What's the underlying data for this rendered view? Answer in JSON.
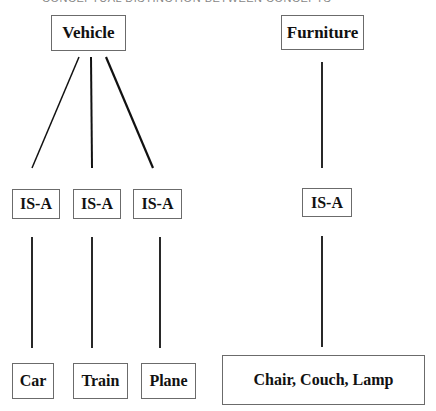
{
  "caption": "CONCEPTUAL DISTINCTION BETWEEN CONCEPTS",
  "nodes": {
    "vehicle": "Vehicle",
    "furniture": "Furniture",
    "isa_1": "IS-A",
    "isa_2": "IS-A",
    "isa_3": "IS-A",
    "isa_4": "IS-A",
    "car": "Car",
    "train": "Train",
    "plane": "Plane",
    "furniture_items": "Chair, Couch, Lamp"
  },
  "edges": [
    {
      "from": "Vehicle",
      "to": "IS-A (1)"
    },
    {
      "from": "Vehicle",
      "to": "IS-A (2)"
    },
    {
      "from": "Vehicle",
      "to": "IS-A (3)"
    },
    {
      "from": "IS-A (1)",
      "to": "Car"
    },
    {
      "from": "IS-A (2)",
      "to": "Train"
    },
    {
      "from": "IS-A (3)",
      "to": "Plane"
    },
    {
      "from": "Furniture",
      "to": "IS-A (4)"
    },
    {
      "from": "IS-A (4)",
      "to": "Chair, Couch, Lamp"
    }
  ]
}
